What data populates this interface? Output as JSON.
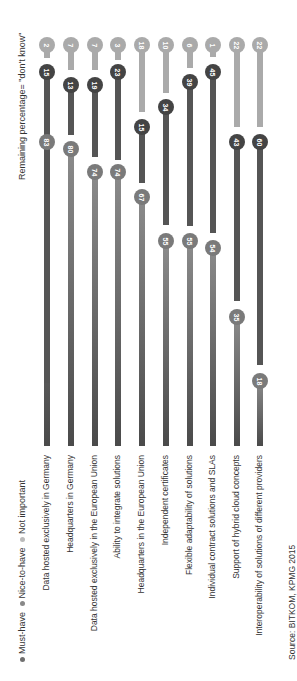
{
  "chart_data": {
    "type": "bar",
    "orientation": "rotated 90deg, stacked dot-bar (lollipop) chart",
    "title": "",
    "note": "Remaining percentage= \"don't know\"",
    "source": "Source: BITKOM, KPMG 2015",
    "categories": [
      "Data hosted exclusively in Germany",
      "Headquarters in Germany",
      "Data hosted exclusively in the European Union",
      "Ability to integrate solutions",
      "Headquarters in the European Union",
      "Independent certificates",
      "Flexible adaptability of solutions",
      "Individual contract solutions and SLAs",
      "Support of hybrid cloud concepts",
      "Interoperability of solutions of different providers"
    ],
    "series": [
      {
        "name": "Must-have",
        "color": "#6f6f6f",
        "values": [
          83,
          80,
          74,
          74,
          67,
          55,
          55,
          54,
          35,
          18
        ]
      },
      {
        "name": "Nice-to-have",
        "color": "#555555",
        "values": [
          15,
          13,
          19,
          23,
          15,
          34,
          39,
          45,
          43,
          60
        ]
      },
      {
        "name": "Not important",
        "color": "#a8a8a8",
        "values": [
          2,
          7,
          7,
          3,
          18,
          10,
          6,
          1,
          22,
          22
        ]
      }
    ],
    "legend": [
      "Must-have",
      "Nice-to-have",
      "Not important"
    ],
    "unit": "%"
  },
  "legend": {
    "must_have": "Must-have",
    "nice_to_have": "Nice-to-have",
    "not_important": "Not important"
  },
  "labels": {
    "note": "Remaining percentage= \"don't know\"",
    "source": "Source: BITKOM, KPMG 2015"
  }
}
